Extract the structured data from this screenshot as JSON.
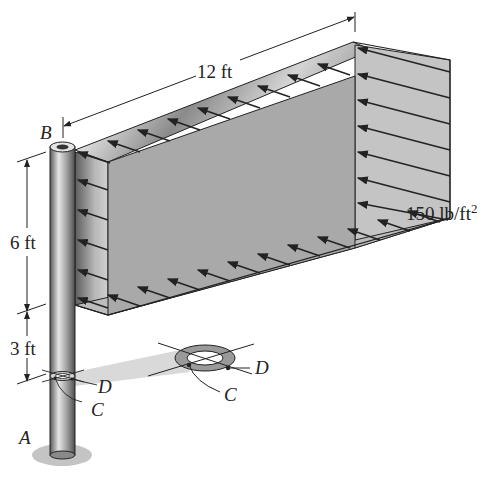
{
  "figure": {
    "type": "engineering-statics-diagram"
  },
  "labels": {
    "point_a": "A",
    "point_b": "B",
    "point_c": "C",
    "point_d": "D",
    "point_c_detail": "C",
    "point_d_detail": "D"
  },
  "dimensions": {
    "sign_length": "12 ft",
    "sign_height": "6 ft",
    "post_below_sign": "3 ft"
  },
  "load": {
    "pressure_value": "150 lb/ft",
    "pressure_exponent": "2"
  },
  "colors": {
    "sign_face": "#a9a9a9",
    "sign_side": "#c8c8c8",
    "pole_dark": "#6e6e6e",
    "pole_light": "#d8d8d8",
    "line": "#222222",
    "shadow": "#cfcfcf"
  }
}
